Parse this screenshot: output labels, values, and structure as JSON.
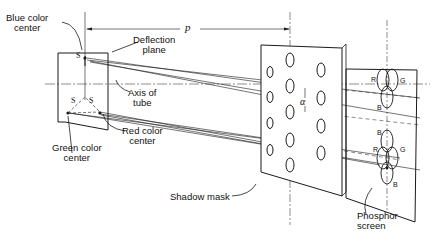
{
  "diagram": {
    "labels": {
      "blue_center": [
        "Blue color",
        "center"
      ],
      "green_center": [
        "Green color",
        "center"
      ],
      "red_center": [
        "Red color",
        "center"
      ],
      "deflection_plane": [
        "Deflection",
        "plane"
      ],
      "axis_of_tube": [
        "Axis of",
        "tube"
      ],
      "shadow_mask": "Shadow mask",
      "phosphor_screen": [
        "Phosphor",
        "screen"
      ],
      "distance_p": "p",
      "angle_alpha": "α"
    },
    "source_markers": [
      "S",
      "S",
      "S"
    ],
    "phosphor_triads": [
      {
        "r": "R",
        "g": "G",
        "b": "B"
      },
      {
        "r": "R",
        "g": "G",
        "b": "B"
      },
      {
        "b_top": "B",
        "b_bottom": "B"
      }
    ],
    "colors": {
      "line": "#1a1a1a",
      "background": "#ffffff"
    }
  }
}
